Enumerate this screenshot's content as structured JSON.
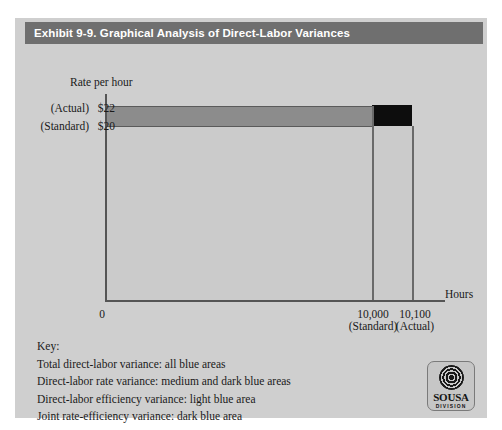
{
  "exhibit": {
    "title": "Exhibit 9-9. Graphical Analysis of Direct-Labor Variances"
  },
  "chart_data": {
    "type": "area",
    "title": "Graphical Analysis of Direct-Labor Variances",
    "xlabel": "Hours",
    "ylabel": "Rate per hour",
    "xlim": [
      0,
      10100
    ],
    "ylim": [
      0,
      22
    ],
    "grid": false,
    "legend_position": "below-plot",
    "y_ticks": [
      {
        "label": "$20",
        "value": 20,
        "qualifier": "(Standard)"
      },
      {
        "label": "$22",
        "value": 22,
        "qualifier": "(Actual)"
      }
    ],
    "x_ticks": [
      {
        "label": "0",
        "value": 0,
        "qualifier": ""
      },
      {
        "label": "10,000",
        "value": 10000,
        "qualifier": "(Standard)"
      },
      {
        "label": "10,100",
        "value": 10100,
        "qualifier": "(Actual)"
      }
    ],
    "regions": [
      {
        "name": "direct-labor efficiency variance",
        "shade": "light blue",
        "x_range": [
          0,
          10000
        ],
        "y_range": [
          0,
          20
        ]
      },
      {
        "name": "direct-labor rate variance (standard hours portion)",
        "shade": "medium blue",
        "x_range": [
          0,
          10000
        ],
        "y_range": [
          20,
          22
        ]
      },
      {
        "name": "joint rate-efficiency variance",
        "shade": "dark blue",
        "x_range": [
          10000,
          10100
        ],
        "y_range": [
          20,
          22
        ]
      },
      {
        "name": "efficiency variance strip",
        "shade": "light blue",
        "x_range": [
          10000,
          10100
        ],
        "y_range": [
          0,
          20
        ]
      }
    ]
  },
  "axes": {
    "y_title": "Rate per hour",
    "x_title": "Hours",
    "y_actual_paren": "(Actual)",
    "y_actual_value": "$22",
    "y_standard_paren": "(Standard)",
    "y_standard_value": "$20",
    "x_zero": "0",
    "x_standard_value": "10,000",
    "x_standard_paren": "(Standard)",
    "x_actual_value": "10,100",
    "x_actual_paren": "(Actual)"
  },
  "key": {
    "heading": "Key:",
    "lines": [
      "Total direct-labor variance: all blue areas",
      "Direct-labor rate variance: medium and dark blue areas",
      "Direct-labor efficiency variance: light blue area",
      "Joint rate-efficiency variance: dark blue area"
    ]
  },
  "logo": {
    "name": "SOUSA",
    "subtitle": "DIVISION"
  },
  "colors": {
    "title_bar": "#6f6f6f",
    "panel": "#cfcfcf",
    "light_area": "#cbcbcb",
    "medium_area": "#8c8c8c",
    "dark_area": "#0d0d0d",
    "axis": "#555555"
  }
}
